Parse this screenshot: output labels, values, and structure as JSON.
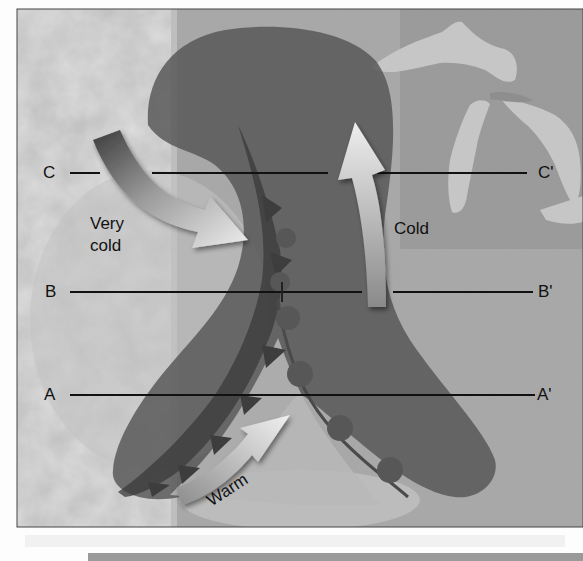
{
  "diagram": {
    "title": "",
    "type": "weather-front-cross-section-map",
    "colors": {
      "page_background": "#fdfdfd",
      "map_land_light": "#b9b9b9",
      "map_land_mid": "#9c9c9c",
      "lakes": "#c4c4c4",
      "cold_air_mass": "#5e5e5e",
      "front_line_dark": "#3a3a3a",
      "arrow_light": "#e6e6e6",
      "section_line": "#111111"
    },
    "section_lines": [
      {
        "id": "C",
        "start_label": "C",
        "end_label": "C'"
      },
      {
        "id": "B",
        "start_label": "B",
        "end_label": "B'"
      },
      {
        "id": "A",
        "start_label": "A",
        "end_label": "A'"
      }
    ],
    "air_mass_labels": {
      "very_cold_line1": "Very",
      "very_cold_line2": "cold",
      "cold": "Cold",
      "warm": "Warm"
    },
    "arrows": [
      {
        "name": "very-cold-air-flow",
        "direction": "southeast"
      },
      {
        "name": "cold-air-flow",
        "direction": "north"
      },
      {
        "name": "warm-air-flow",
        "direction": "northeast"
      }
    ],
    "fronts": [
      {
        "name": "cold-front",
        "symbol": "triangles"
      },
      {
        "name": "warm-front",
        "symbol": "semicircles"
      }
    ]
  }
}
